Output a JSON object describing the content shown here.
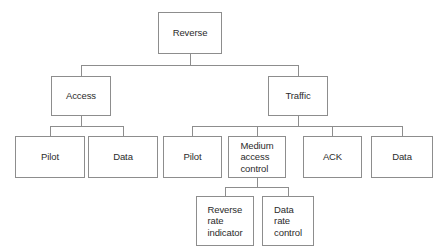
{
  "diagram": {
    "type": "tree",
    "background_color": "#ffffff",
    "border_color": "#8d8d8d",
    "text_color": "#2b2b2b",
    "nodes": [
      {
        "id": "reverse",
        "label": "Reverse",
        "level": 1,
        "parent": null,
        "x": 158,
        "y": 12,
        "w": 64,
        "h": 42,
        "multiline": false
      },
      {
        "id": "access",
        "label": "Access",
        "level": 2,
        "parent": "reverse",
        "x": 51,
        "y": 76,
        "w": 60,
        "h": 40,
        "multiline": false
      },
      {
        "id": "traffic",
        "label": "Traffic",
        "level": 2,
        "parent": "reverse",
        "x": 268,
        "y": 76,
        "w": 60,
        "h": 40,
        "multiline": false
      },
      {
        "id": "a-pilot",
        "label": "Pilot",
        "level": 3,
        "parent": "access",
        "x": 15,
        "y": 136,
        "w": 70,
        "h": 42,
        "multiline": false
      },
      {
        "id": "a-data",
        "label": "Data",
        "level": 3,
        "parent": "access",
        "x": 88,
        "y": 136,
        "w": 70,
        "h": 42,
        "multiline": false
      },
      {
        "id": "t-pilot",
        "label": "Pilot",
        "level": 3,
        "parent": "traffic",
        "x": 163,
        "y": 136,
        "w": 59,
        "h": 42,
        "multiline": false
      },
      {
        "id": "t-mac",
        "label": "Medium\naccess\ncontrol",
        "level": 3,
        "parent": "traffic",
        "x": 228,
        "y": 136,
        "w": 58,
        "h": 42,
        "multiline": true
      },
      {
        "id": "t-ack",
        "label": "ACK",
        "level": 3,
        "parent": "traffic",
        "x": 303,
        "y": 136,
        "w": 59,
        "h": 42,
        "multiline": false
      },
      {
        "id": "t-data",
        "label": "Data",
        "level": 3,
        "parent": "traffic",
        "x": 371,
        "y": 136,
        "w": 62,
        "h": 42,
        "multiline": false
      },
      {
        "id": "m-rri",
        "label": "Reverse\nrate\nindicator",
        "level": 4,
        "parent": "t-mac",
        "x": 196,
        "y": 196,
        "w": 58,
        "h": 50,
        "multiline": true
      },
      {
        "id": "m-drc",
        "label": "Data\nrate\ncontrol",
        "level": 4,
        "parent": "t-mac",
        "x": 262,
        "y": 196,
        "w": 52,
        "h": 50,
        "multiline": true
      }
    ],
    "connectors": [
      {
        "id": "c-root-stub",
        "orient": "v",
        "x": 190,
        "y": 54,
        "len": 11
      },
      {
        "id": "c-root-bus",
        "orient": "h",
        "x": 81,
        "y": 65,
        "len": 217
      },
      {
        "id": "c-access-drop",
        "orient": "v",
        "x": 81,
        "y": 65,
        "len": 11
      },
      {
        "id": "c-traffic-drop",
        "orient": "v",
        "x": 298,
        "y": 65,
        "len": 11
      },
      {
        "id": "c-access-stub",
        "orient": "v",
        "x": 81,
        "y": 116,
        "len": 10
      },
      {
        "id": "c-access-bus",
        "orient": "h",
        "x": 50,
        "y": 126,
        "len": 73
      },
      {
        "id": "c-apilot-drop",
        "orient": "v",
        "x": 50,
        "y": 126,
        "len": 10
      },
      {
        "id": "c-adata-drop",
        "orient": "v",
        "x": 123,
        "y": 126,
        "len": 10
      },
      {
        "id": "c-traffic-stub",
        "orient": "v",
        "x": 298,
        "y": 116,
        "len": 10
      },
      {
        "id": "c-traffic-bus",
        "orient": "h",
        "x": 192,
        "y": 126,
        "len": 210
      },
      {
        "id": "c-tpilot-drop",
        "orient": "v",
        "x": 192,
        "y": 126,
        "len": 10
      },
      {
        "id": "c-tmac-drop",
        "orient": "v",
        "x": 257,
        "y": 126,
        "len": 10
      },
      {
        "id": "c-tack-drop",
        "orient": "v",
        "x": 332,
        "y": 126,
        "len": 10
      },
      {
        "id": "c-tdata-drop",
        "orient": "v",
        "x": 402,
        "y": 126,
        "len": 10
      },
      {
        "id": "c-mac-stub",
        "orient": "v",
        "x": 257,
        "y": 178,
        "len": 9
      },
      {
        "id": "c-mac-bus",
        "orient": "h",
        "x": 225,
        "y": 187,
        "len": 63
      },
      {
        "id": "c-rri-drop",
        "orient": "v",
        "x": 225,
        "y": 187,
        "len": 9
      },
      {
        "id": "c-drc-drop",
        "orient": "v",
        "x": 288,
        "y": 187,
        "len": 9
      }
    ]
  }
}
